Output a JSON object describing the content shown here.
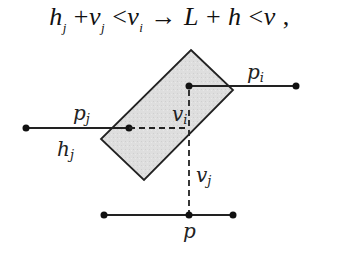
{
  "formula": {
    "h": "h",
    "j1": "j",
    "plus1": " +",
    "v1": "v",
    "j2": "j",
    "lt1": " <",
    "v2": "v",
    "i1": "i",
    "arrow": " → ",
    "L": "L",
    "plus2": " + ",
    "h2": "h",
    "lt2": " <",
    "v3": "v",
    "comma": " ,"
  },
  "labels": {
    "p_i": "p",
    "p_i_sub": "i",
    "p_j": "p",
    "p_j_sub": "j",
    "h_j": "h",
    "h_j_sub": "j",
    "v_i": "v",
    "v_i_sub": "i",
    "v_j": "v",
    "v_j_sub": "j",
    "p": "p"
  },
  "colors": {
    "box_fill": "#dcdcdc",
    "stroke": "#222222"
  }
}
